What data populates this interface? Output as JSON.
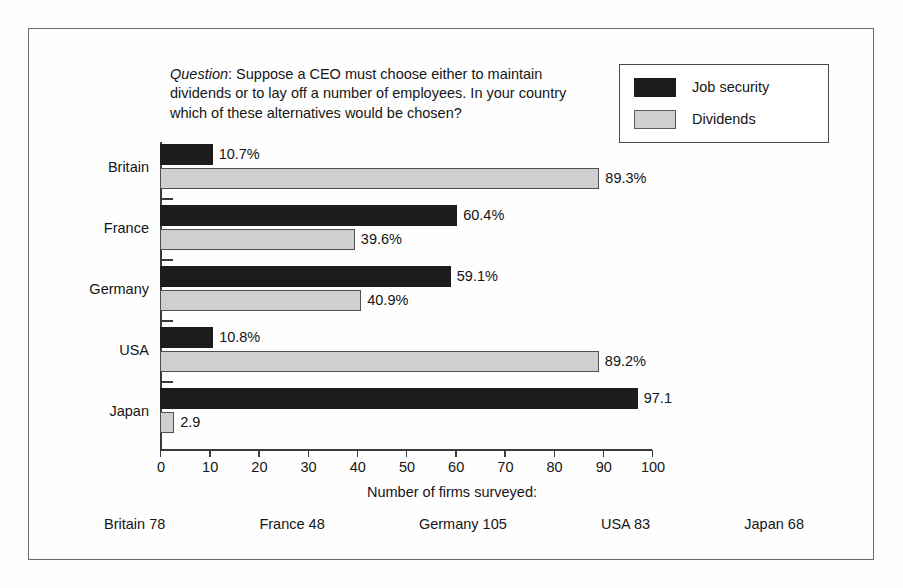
{
  "question": {
    "lead": "Question",
    "text": ": Suppose a CEO must choose either to maintain dividends or to lay off a number of employees. In your country which of these alternatives would be chosen?"
  },
  "legend": {
    "items": [
      {
        "label": "Job security",
        "swatch": "dark-swatch-icon",
        "color": "#1c1c1c"
      },
      {
        "label": "Dividends",
        "swatch": "light-swatch-icon",
        "color": "#cfcfcf"
      }
    ]
  },
  "footer": {
    "title": "Number of firms surveyed:",
    "counts": [
      {
        "label": "Britain 78"
      },
      {
        "label": "France 48"
      },
      {
        "label": "Germany 105"
      },
      {
        "label": "USA 83"
      },
      {
        "label": "Japan 68"
      }
    ]
  },
  "chart_data": {
    "type": "bar",
    "orientation": "horizontal",
    "title": "",
    "xlabel": "",
    "ylabel": "",
    "xlim": [
      0,
      100
    ],
    "grid": false,
    "legend_position": "top-right",
    "xticks": [
      0,
      10,
      20,
      30,
      40,
      50,
      60,
      70,
      80,
      90,
      100
    ],
    "xticklabels": [
      "0",
      "10",
      "20",
      "30",
      "40",
      "50",
      "60",
      "70",
      "80",
      "90",
      "100"
    ],
    "categories": [
      "Britain",
      "France",
      "Germany",
      "USA",
      "Japan"
    ],
    "series": [
      {
        "name": "Job security",
        "color": "#1c1c1c",
        "values": [
          10.7,
          60.4,
          59.1,
          10.8,
          97.1
        ],
        "labels": [
          "10.7%",
          "60.4%",
          "59.1%",
          "10.8%",
          "97.1"
        ]
      },
      {
        "name": "Dividends",
        "color": "#cfcfcf",
        "values": [
          89.3,
          39.6,
          40.9,
          89.2,
          2.9
        ],
        "labels": [
          "89.3%",
          "39.6%",
          "40.9%",
          "89.2%",
          "2.9"
        ]
      }
    ]
  }
}
